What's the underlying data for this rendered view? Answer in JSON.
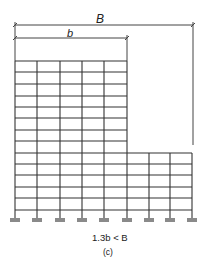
{
  "figure": {
    "label_B": "B",
    "label_b": "b",
    "condition": "1.3b < B",
    "caption": "(c)"
  },
  "structure": {
    "columns_x": [
      15,
      37,
      60,
      82,
      104,
      127,
      149,
      170,
      192
    ],
    "tall_section_columns": 6,
    "floor_y": [
      61,
      72,
      84,
      96,
      107,
      118,
      130,
      141,
      153,
      164,
      175,
      187,
      198,
      210
    ],
    "low_section_top_y": 153,
    "base_y": 218,
    "support_color": "#8a8a8a",
    "line_color": "#333333"
  },
  "dimensions": {
    "B": {
      "x1": 15,
      "x2": 193,
      "y": 25
    },
    "b": {
      "x1": 15,
      "x2": 127,
      "y": 38
    },
    "B_right_extension_bottom": 145
  }
}
